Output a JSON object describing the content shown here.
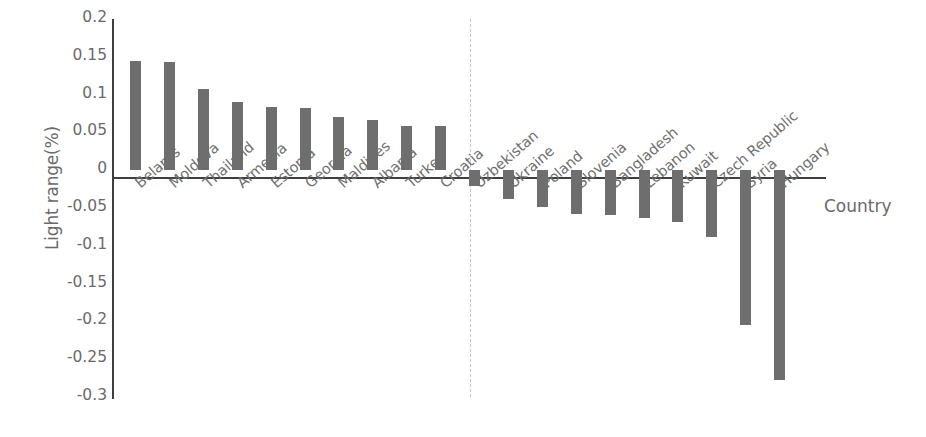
{
  "chart_data": {
    "type": "bar",
    "title": "",
    "xlabel": "Country",
    "ylabel": "Light range(%)",
    "ylim": [
      -0.3,
      0.2
    ],
    "yticks": [
      "0.2",
      "0.15",
      "0.1",
      "0.05",
      "0",
      "-0.05",
      "-0.1",
      "-0.15",
      "-0.2",
      "-0.25",
      "-0.3"
    ],
    "ytick_values": [
      0.2,
      0.15,
      0.1,
      0.05,
      0,
      -0.05,
      -0.1,
      -0.15,
      -0.2,
      -0.25,
      -0.3
    ],
    "grid": false,
    "legend": null,
    "bar_color": "#6e6e6e",
    "axis_color": "#3f3f3f",
    "divider_color": "#c9c4c0",
    "divider_after_category": "Croatia",
    "categories": [
      "Belarus",
      "Moldova",
      "Thailand",
      "Armenia",
      "Estonia",
      "Georgia",
      "Maldives",
      "Albania",
      "Turkey",
      "Croatia",
      "Uzbekistan",
      "Ukraine",
      "Poland",
      "Slovenia",
      "Bangladesh",
      "Lebanon",
      "Kuwait",
      "Czech Republic",
      "Syria",
      "Hungary"
    ],
    "values": [
      0.144,
      0.143,
      0.108,
      0.09,
      0.083,
      0.082,
      0.071,
      0.067,
      0.058,
      0.058,
      -0.021,
      -0.038,
      -0.049,
      -0.058,
      -0.059,
      -0.063,
      -0.068,
      -0.088,
      -0.205,
      -0.277
    ]
  }
}
